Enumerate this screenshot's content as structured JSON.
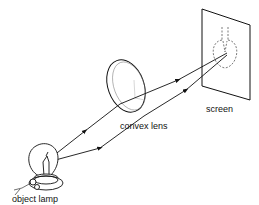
{
  "diagram": {
    "type": "optics-ray-diagram",
    "labels": {
      "screen": "screen",
      "lens": "convex lens",
      "lamp": "object lamp"
    },
    "colors": {
      "stroke": "#111111",
      "background": "#ffffff"
    }
  }
}
